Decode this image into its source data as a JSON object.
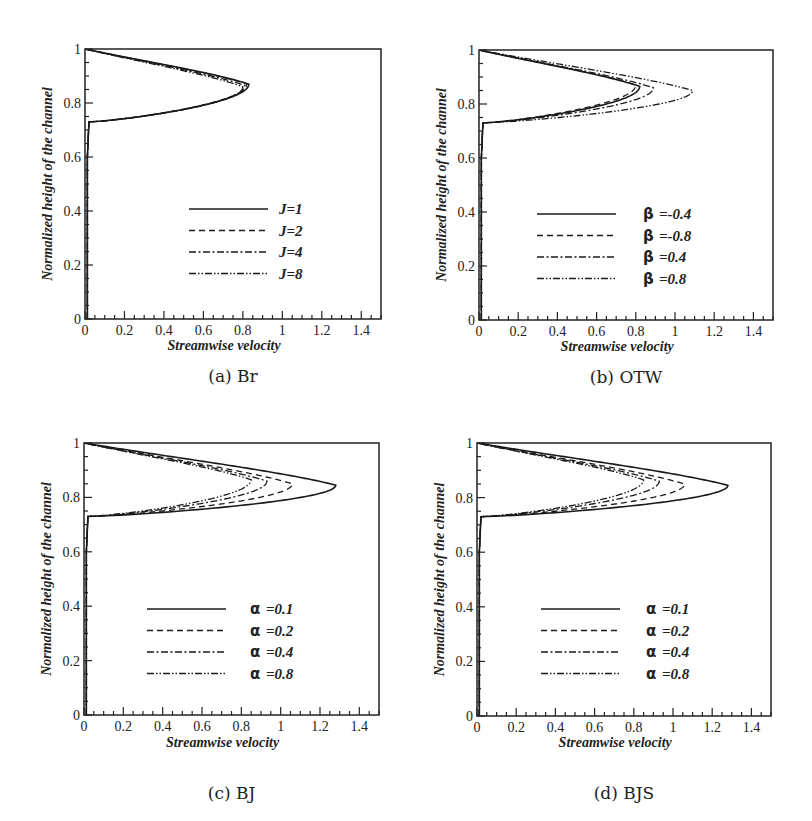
{
  "figure": {
    "panels_count": 4
  },
  "chart_data": [
    {
      "id": "a",
      "type": "line",
      "caption": "(a) Br",
      "xlabel": "Streamwise velocity",
      "ylabel": "Normalized height of the channel",
      "xlim": [
        0,
        1.5
      ],
      "ylim": [
        0,
        1
      ],
      "xticks": [
        "0",
        "0.2",
        "0.4",
        "0.6",
        "0.8",
        "1",
        "1.2",
        "1.4"
      ],
      "yticks": [
        "0",
        "0.2",
        "0.4",
        "0.6",
        "0.8",
        "1"
      ],
      "grid": false,
      "legend_position": "lower-center",
      "legend_prefix": "",
      "series": [
        {
          "name": "J=1",
          "label": "J=1",
          "style": "solid",
          "peak_u": 0.83,
          "peak_y": 0.87
        },
        {
          "name": "J=2",
          "label": "J=2",
          "style": "dashed",
          "peak_u": 0.82,
          "peak_y": 0.87
        },
        {
          "name": "J=4",
          "label": "J=4",
          "style": "dashdot",
          "peak_u": 0.81,
          "peak_y": 0.865
        },
        {
          "name": "J=8",
          "label": "J=8",
          "style": "dashdotdot",
          "peak_u": 0.8,
          "peak_y": 0.86
        }
      ]
    },
    {
      "id": "b",
      "type": "line",
      "caption": "(b) OTW",
      "xlabel": "Streamwise velocity",
      "ylabel": "Normalized height of the channel",
      "xlim": [
        0,
        1.5
      ],
      "ylim": [
        0,
        1
      ],
      "xticks": [
        "0",
        "0.2",
        "0.4",
        "0.6",
        "0.8",
        "1",
        "1.2",
        "1.4"
      ],
      "yticks": [
        "0",
        "0.2",
        "0.4",
        "0.6",
        "0.8",
        "1"
      ],
      "grid": false,
      "legend_position": "lower-center",
      "legend_prefix": "β",
      "series": [
        {
          "name": "β=-0.4",
          "label": "=-0.4",
          "style": "solid",
          "peak_u": 0.82,
          "peak_y": 0.865
        },
        {
          "name": "β=-0.8",
          "label": "=-0.8",
          "style": "dashed",
          "peak_u": 0.8,
          "peak_y": 0.87
        },
        {
          "name": "β=0.4",
          "label": "=0.4",
          "style": "dashdot",
          "peak_u": 0.89,
          "peak_y": 0.86
        },
        {
          "name": "β=0.8",
          "label": "=0.8",
          "style": "dashdotdot",
          "peak_u": 1.09,
          "peak_y": 0.85
        }
      ]
    },
    {
      "id": "c",
      "type": "line",
      "caption": "(c) BJ",
      "xlabel": "Streamwise velocity",
      "ylabel": "Normalized height of the channel",
      "xlim": [
        0,
        1.5
      ],
      "ylim": [
        0,
        1
      ],
      "xticks": [
        "0",
        "0.2",
        "0.4",
        "0.6",
        "0.8",
        "1",
        "1.2",
        "1.4"
      ],
      "yticks": [
        "0",
        "0.2",
        "0.4",
        "0.6",
        "0.8",
        "1"
      ],
      "grid": false,
      "legend_position": "lower-center",
      "legend_prefix": "α",
      "series": [
        {
          "name": "α=0.1",
          "label": "=0.1",
          "style": "solid",
          "peak_u": 1.28,
          "peak_y": 0.845
        },
        {
          "name": "α=0.2",
          "label": "=0.2",
          "style": "dashed",
          "peak_u": 1.06,
          "peak_y": 0.85
        },
        {
          "name": "α=0.4",
          "label": "=0.4",
          "style": "dashdot",
          "peak_u": 0.93,
          "peak_y": 0.86
        },
        {
          "name": "α=0.8",
          "label": "=0.8",
          "style": "dashdotdot",
          "peak_u": 0.85,
          "peak_y": 0.865
        }
      ]
    },
    {
      "id": "d",
      "type": "line",
      "caption": "(d) BJS",
      "xlabel": "Streamwise velocity",
      "ylabel": "Normalized height of the channel",
      "xlim": [
        0,
        1.5
      ],
      "ylim": [
        0,
        1
      ],
      "xticks": [
        "0",
        "0.2",
        "0.4",
        "0.6",
        "0.8",
        "1",
        "1.2",
        "1.4"
      ],
      "yticks": [
        "0",
        "0.2",
        "0.4",
        "0.6",
        "0.8",
        "1"
      ],
      "grid": false,
      "legend_position": "lower-center",
      "legend_prefix": "α",
      "series": [
        {
          "name": "α=0.1",
          "label": "=0.1",
          "style": "solid",
          "peak_u": 1.28,
          "peak_y": 0.845
        },
        {
          "name": "α=0.2",
          "label": "=0.2",
          "style": "dashed",
          "peak_u": 1.06,
          "peak_y": 0.85
        },
        {
          "name": "α=0.4",
          "label": "=0.4",
          "style": "dashdot",
          "peak_u": 0.93,
          "peak_y": 0.86
        },
        {
          "name": "α=0.8",
          "label": "=0.8",
          "style": "dashdotdot",
          "peak_u": 0.85,
          "peak_y": 0.865
        }
      ]
    }
  ],
  "layout": {
    "panels": [
      {
        "x0": 85,
        "y0": 49,
        "x1": 381,
        "y1": 319,
        "legend_x": 189,
        "legend_text_x": 279,
        "legend_y": 209,
        "caption_y": 360,
        "xlabel_y": 350
      },
      {
        "x0": 479,
        "y0": 50,
        "x1": 773,
        "y1": 320,
        "legend_x": 537,
        "legend_text_x": 643,
        "legend_y": 214,
        "caption_y": 361,
        "xlabel_y": 351
      },
      {
        "x0": 84,
        "y0": 443,
        "x1": 379,
        "y1": 715,
        "legend_x": 147,
        "legend_text_x": 250,
        "legend_y": 609,
        "caption_y": 777,
        "xlabel_y": 747
      },
      {
        "x0": 477,
        "y0": 443,
        "x1": 771,
        "y1": 716,
        "legend_x": 541,
        "legend_text_x": 646,
        "legend_y": 609,
        "caption_y": 777,
        "xlabel_y": 747
      }
    ]
  }
}
